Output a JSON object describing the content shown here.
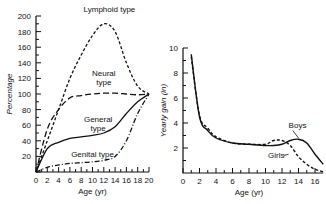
{
  "chart_data": [
    {
      "type": "line",
      "title": "",
      "xlabel": "Age (yr)",
      "ylabel": "Percentage",
      "xlim": [
        0,
        20
      ],
      "ylim": [
        0,
        200
      ],
      "x_ticks": [
        "0",
        "2",
        "4",
        "6",
        "8",
        "10",
        "12",
        "14",
        "16",
        "18",
        "20"
      ],
      "y_ticks": [
        "20",
        "40",
        "60",
        "80",
        "100",
        "120",
        "140",
        "160",
        "180",
        "200"
      ],
      "grid": false,
      "x": [
        0,
        2,
        4,
        6,
        8,
        10,
        12,
        14,
        16,
        18,
        20
      ],
      "series": [
        {
          "name": "Lymphoid type",
          "style": "dashed",
          "values": [
            0,
            40,
            80,
            120,
            150,
            175,
            190,
            180,
            140,
            110,
            100
          ]
        },
        {
          "name": "Neural type",
          "style": "long-dash",
          "values": [
            0,
            55,
            80,
            95,
            98,
            100,
            101,
            101,
            100,
            99,
            100
          ]
        },
        {
          "name": "General type",
          "style": "solid",
          "values": [
            0,
            30,
            38,
            43,
            45,
            47,
            50,
            58,
            75,
            90,
            100
          ]
        },
        {
          "name": "Genital type",
          "style": "dash-dot",
          "values": [
            0,
            6,
            9,
            11,
            12,
            13,
            15,
            20,
            40,
            75,
            100
          ]
        }
      ],
      "annotations": [
        "Lymphoid type",
        "Neural type",
        "General type",
        "Genital type"
      ]
    },
    {
      "type": "line",
      "title": "",
      "xlabel": "Age (yr)",
      "ylabel": "Yearly gain (in)",
      "xlim": [
        0,
        17
      ],
      "ylim": [
        0,
        10
      ],
      "x_ticks": [
        "0",
        "2",
        "4",
        "6",
        "8",
        "10",
        "12",
        "14",
        "16"
      ],
      "y_ticks": [
        "2",
        "4",
        "6",
        "8",
        "10"
      ],
      "grid": false,
      "x": [
        1,
        2,
        3,
        4,
        6,
        8,
        10,
        11,
        12,
        13,
        14,
        15,
        16,
        17
      ],
      "series": [
        {
          "name": "Boys",
          "style": "solid",
          "values": [
            9.5,
            4.5,
            3.4,
            2.8,
            2.4,
            2.3,
            2.2,
            2.2,
            2.3,
            2.6,
            2.7,
            2.4,
            1.5,
            0.7
          ]
        },
        {
          "name": "Girls",
          "style": "dashed",
          "values": [
            9.3,
            4.6,
            3.6,
            2.9,
            2.4,
            2.3,
            2.3,
            2.6,
            2.6,
            2.2,
            1.3,
            0.7,
            0.3,
            0.1
          ]
        }
      ],
      "annotations": [
        "Boys",
        "Girls"
      ]
    }
  ]
}
